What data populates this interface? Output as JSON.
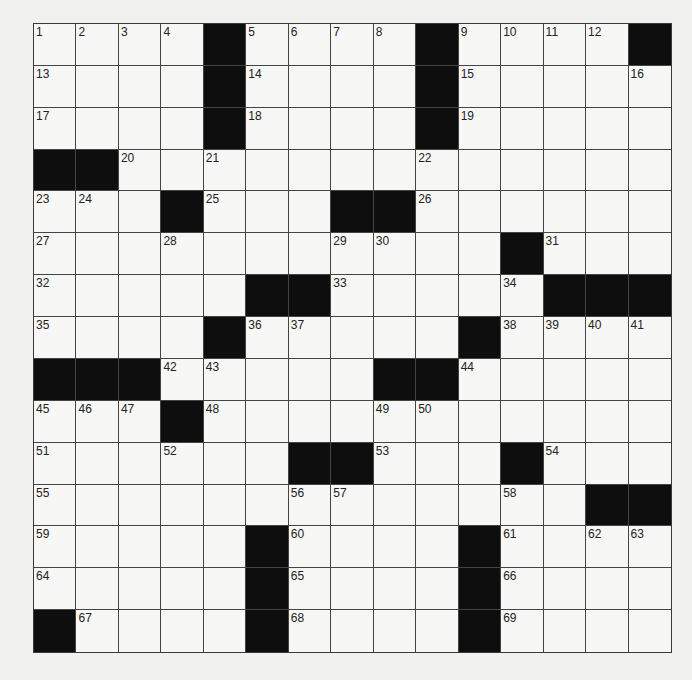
{
  "puzzle": {
    "rows": 15,
    "cols": 15,
    "grid": [
      [
        "1",
        "2",
        "3",
        "4",
        "#",
        "5",
        "6",
        "7",
        "8",
        "#",
        "9",
        "10",
        "11",
        "12",
        "#"
      ],
      [
        "13",
        "",
        "",
        "",
        "#",
        "14",
        "",
        "",
        "",
        "#",
        "15",
        "",
        "",
        "",
        "16"
      ],
      [
        "17",
        "",
        "",
        "",
        "#",
        "18",
        "",
        "",
        "",
        "#",
        "19",
        "",
        "",
        "",
        ""
      ],
      [
        "#",
        "#",
        "20",
        "",
        "21",
        "",
        "",
        "",
        "",
        "22",
        "",
        "",
        "",
        "",
        ""
      ],
      [
        "23",
        "24",
        "",
        "#",
        "25",
        "",
        "",
        "#",
        "#",
        "26",
        "",
        "",
        "",
        "",
        ""
      ],
      [
        "27",
        "",
        "",
        "28",
        "",
        "",
        "",
        "29",
        "30",
        "",
        "",
        "#",
        "31",
        "",
        ""
      ],
      [
        "32",
        "",
        "",
        "",
        "",
        "#",
        "#",
        "33",
        "",
        "",
        "",
        "34",
        "#",
        "#",
        "#"
      ],
      [
        "35",
        "",
        "",
        "",
        "#",
        "36",
        "37",
        "",
        "",
        "",
        "#",
        "38",
        "39",
        "40",
        "41"
      ],
      [
        "#",
        "#",
        "#",
        "42",
        "43",
        "",
        "",
        "",
        "#",
        "#",
        "44",
        "",
        "",
        "",
        ""
      ],
      [
        "45",
        "46",
        "47",
        "#",
        "48",
        "",
        "",
        "",
        "49",
        "50",
        "",
        "",
        "",
        "",
        ""
      ],
      [
        "51",
        "",
        "",
        "52",
        "",
        "",
        "#",
        "#",
        "53",
        "",
        "",
        "#",
        "54",
        "",
        ""
      ],
      [
        "55",
        "",
        "",
        "",
        "",
        "",
        "56",
        "57",
        "",
        "",
        "",
        "58",
        "",
        "#",
        "#"
      ],
      [
        "59",
        "",
        "",
        "",
        "",
        "#",
        "60",
        "",
        "",
        "",
        "#",
        "61",
        "",
        "62",
        "63"
      ],
      [
        "64",
        "",
        "",
        "",
        "",
        "#",
        "65",
        "",
        "",
        "",
        "#",
        "66",
        "",
        "",
        ""
      ],
      [
        "#",
        "67",
        "",
        "",
        "",
        "#",
        "68",
        "",
        "",
        "",
        "#",
        "69",
        "",
        "",
        ""
      ]
    ]
  }
}
